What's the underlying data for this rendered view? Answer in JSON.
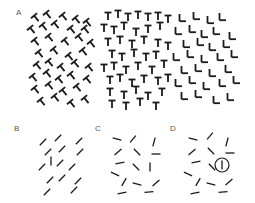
{
  "figure": {
    "panels": [
      {
        "label": "A",
        "description": "Texture array: tilted T's (left), upright T's (middle), L's (right)"
      },
      {
        "label": "B",
        "description": "Oblique line segments with one vertical odd element"
      },
      {
        "label": "C",
        "description": "Randomly oriented line segments"
      },
      {
        "label": "D",
        "description": "Randomly oriented line segments with target circled"
      }
    ],
    "colors": {
      "ink": "#1a1a1a",
      "label": "#555555",
      "background": "#ffffff"
    },
    "panelA": {
      "rows": [
        17,
        29,
        41,
        53,
        65,
        77,
        89,
        101
      ],
      "tilted_T": [
        [
          36,
          18
        ],
        [
          48,
          15
        ],
        [
          64,
          17
        ],
        [
          77,
          20
        ],
        [
          88,
          23
        ],
        [
          32,
          30
        ],
        [
          44,
          27
        ],
        [
          56,
          25
        ],
        [
          72,
          30
        ],
        [
          86,
          30
        ],
        [
          36,
          42
        ],
        [
          50,
          38
        ],
        [
          66,
          42
        ],
        [
          80,
          38
        ],
        [
          92,
          44
        ],
        [
          40,
          54
        ],
        [
          55,
          51
        ],
        [
          70,
          57
        ],
        [
          84,
          52
        ],
        [
          38,
          66
        ],
        [
          50,
          63
        ],
        [
          62,
          68
        ],
        [
          76,
          64
        ],
        [
          90,
          68
        ],
        [
          34,
          78
        ],
        [
          48,
          74
        ],
        [
          60,
          80
        ],
        [
          72,
          76
        ],
        [
          88,
          80
        ],
        [
          36,
          90
        ],
        [
          50,
          86
        ],
        [
          64,
          92
        ],
        [
          78,
          88
        ],
        [
          42,
          102
        ],
        [
          56,
          98
        ],
        [
          72,
          104
        ],
        [
          86,
          100
        ]
      ],
      "upright_T": [
        [
          108,
          16
        ],
        [
          118,
          14
        ],
        [
          128,
          17
        ],
        [
          138,
          15
        ],
        [
          148,
          17
        ],
        [
          158,
          16
        ],
        [
          168,
          19
        ],
        [
          104,
          28
        ],
        [
          114,
          30
        ],
        [
          124,
          26
        ],
        [
          136,
          32
        ],
        [
          148,
          29
        ],
        [
          160,
          26
        ],
        [
          108,
          42
        ],
        [
          120,
          40
        ],
        [
          132,
          44
        ],
        [
          144,
          40
        ],
        [
          158,
          43
        ],
        [
          168,
          46
        ],
        [
          112,
          54
        ],
        [
          122,
          57
        ],
        [
          134,
          53
        ],
        [
          146,
          57
        ],
        [
          156,
          55
        ],
        [
          104,
          68
        ],
        [
          114,
          66
        ],
        [
          126,
          70
        ],
        [
          138,
          66
        ],
        [
          152,
          70
        ],
        [
          164,
          64
        ],
        [
          110,
          80
        ],
        [
          120,
          78
        ],
        [
          132,
          83
        ],
        [
          144,
          79
        ],
        [
          158,
          81
        ],
        [
          168,
          78
        ],
        [
          110,
          92
        ],
        [
          124,
          95
        ],
        [
          136,
          90
        ],
        [
          148,
          96
        ],
        [
          162,
          92
        ],
        [
          112,
          104
        ],
        [
          126,
          106
        ],
        [
          140,
          102
        ],
        [
          156,
          106
        ]
      ],
      "L": [
        [
          182,
          18
        ],
        [
          196,
          16
        ],
        [
          210,
          20
        ],
        [
          222,
          17
        ],
        [
          178,
          31
        ],
        [
          192,
          29
        ],
        [
          204,
          34
        ],
        [
          216,
          31
        ],
        [
          232,
          36
        ],
        [
          186,
          44
        ],
        [
          200,
          42
        ],
        [
          212,
          47
        ],
        [
          226,
          44
        ],
        [
          176,
          57
        ],
        [
          190,
          54
        ],
        [
          204,
          59
        ],
        [
          220,
          57
        ],
        [
          234,
          54
        ],
        [
          184,
          70
        ],
        [
          198,
          68
        ],
        [
          212,
          73
        ],
        [
          228,
          69
        ],
        [
          178,
          83
        ],
        [
          192,
          80
        ],
        [
          206,
          86
        ],
        [
          222,
          83
        ],
        [
          236,
          80
        ],
        [
          184,
          96
        ],
        [
          198,
          94
        ],
        [
          216,
          100
        ],
        [
          230,
          97
        ]
      ]
    },
    "panelB": {
      "segments": [
        [
          43,
          142,
          45
        ],
        [
          58,
          138,
          45
        ],
        [
          79,
          141,
          45
        ],
        [
          48,
          152,
          45
        ],
        [
          62,
          149,
          45
        ],
        [
          80,
          152,
          45
        ],
        [
          51,
          161,
          90
        ],
        [
          42,
          167,
          45
        ],
        [
          60,
          163,
          45
        ],
        [
          72,
          167,
          45
        ],
        [
          50,
          180,
          45
        ],
        [
          62,
          178,
          45
        ],
        [
          78,
          181,
          45
        ],
        [
          47,
          192,
          45
        ],
        [
          74,
          190,
          45
        ]
      ],
      "odd_index": 6
    },
    "panelC": {
      "segments": [
        [
          117,
          139,
          -15
        ],
        [
          133,
          139,
          50
        ],
        [
          154,
          142,
          75
        ],
        [
          118,
          152,
          40
        ],
        [
          137,
          152,
          -45
        ],
        [
          156,
          154,
          0
        ],
        [
          120,
          163,
          10
        ],
        [
          136,
          167,
          -45
        ],
        [
          150,
          167,
          90
        ],
        [
          115,
          174,
          -25
        ],
        [
          124,
          182,
          60
        ],
        [
          137,
          184,
          -15
        ],
        [
          156,
          183,
          40
        ],
        [
          122,
          193,
          10
        ],
        [
          149,
          192,
          5
        ]
      ]
    },
    "panelD": {
      "segments": [
        [
          193,
          139,
          -15
        ],
        [
          210,
          136,
          50
        ],
        [
          227,
          142,
          75
        ],
        [
          192,
          152,
          40
        ],
        [
          211,
          151,
          -45
        ],
        [
          230,
          153,
          0
        ],
        [
          196,
          162,
          10
        ],
        [
          212,
          167,
          -45
        ],
        [
          222,
          165,
          90
        ],
        [
          188,
          174,
          -25
        ],
        [
          198,
          182,
          60
        ],
        [
          211,
          184,
          -15
        ],
        [
          229,
          182,
          40
        ],
        [
          195,
          193,
          10
        ],
        [
          223,
          192,
          5
        ]
      ],
      "target": {
        "x": 222,
        "y": 165,
        "r": 7
      }
    }
  }
}
